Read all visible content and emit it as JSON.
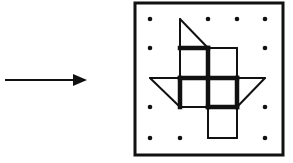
{
  "diagram": {
    "colors": {
      "ink": "#111111",
      "background": "#ffffff"
    },
    "arrow": {
      "x1": 5,
      "y1": 80,
      "x2": 87,
      "y2": 80,
      "head_length": 14,
      "head_half_width": 6
    },
    "frame": {
      "x": 135,
      "y": 3,
      "width": 148,
      "height": 152,
      "stroke_width": 3
    },
    "grid": {
      "columns": [
        150,
        180,
        208,
        237,
        265
      ],
      "rows": [
        19,
        48,
        78,
        107,
        138
      ],
      "dot_radius": 2.3
    },
    "dots": [
      [
        0,
        0
      ],
      [
        2,
        0
      ],
      [
        3,
        0
      ],
      [
        4,
        0
      ],
      [
        0,
        1
      ],
      [
        4,
        1
      ],
      [
        0,
        3
      ],
      [
        4,
        3
      ],
      [
        0,
        4
      ],
      [
        1,
        4
      ],
      [
        4,
        4
      ]
    ],
    "thin_segments": [
      [
        [
          1,
          0
        ],
        [
          1,
          1
        ]
      ],
      [
        [
          1,
          0
        ],
        [
          2,
          1
        ]
      ],
      [
        [
          2,
          1
        ],
        [
          3,
          1
        ]
      ],
      [
        [
          3,
          1
        ],
        [
          3,
          2
        ]
      ],
      [
        [
          0,
          2
        ],
        [
          1,
          2
        ]
      ],
      [
        [
          3,
          2
        ],
        [
          4,
          2
        ]
      ],
      [
        [
          0,
          2
        ],
        [
          1,
          3
        ]
      ],
      [
        [
          4,
          2
        ],
        [
          3,
          3
        ]
      ],
      [
        [
          1,
          3
        ],
        [
          2,
          3
        ]
      ],
      [
        [
          1,
          1
        ],
        [
          1,
          2
        ]
      ],
      [
        [
          2,
          3
        ],
        [
          2,
          4
        ]
      ],
      [
        [
          3,
          3
        ],
        [
          3,
          4
        ]
      ],
      [
        [
          2,
          4
        ],
        [
          3,
          4
        ]
      ]
    ],
    "thick_segments": [
      [
        [
          1,
          1
        ],
        [
          2,
          1
        ]
      ],
      [
        [
          2,
          1
        ],
        [
          2,
          2
        ]
      ],
      [
        [
          1,
          2
        ],
        [
          3,
          2
        ]
      ],
      [
        [
          1,
          2
        ],
        [
          1,
          3
        ]
      ],
      [
        [
          2,
          2
        ],
        [
          2,
          3
        ]
      ],
      [
        [
          3,
          2
        ],
        [
          3,
          3
        ]
      ],
      [
        [
          2,
          3
        ],
        [
          3,
          3
        ]
      ]
    ],
    "thin_width": 2,
    "thick_width": 4.5
  }
}
